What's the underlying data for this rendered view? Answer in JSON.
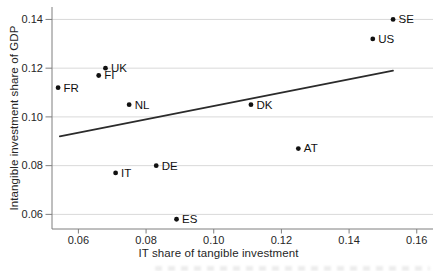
{
  "chart_data": {
    "type": "scatter",
    "title": "",
    "xlabel": "IT share of tangible investment",
    "ylabel": "Intangible investment share of GDP",
    "xlim": [
      0.0522,
      0.1648
    ],
    "ylim": [
      0.054,
      0.1451
    ],
    "grid": "horizontal-only",
    "legend": "none",
    "xticks": {
      "values": [
        0.06,
        0.08,
        0.1,
        0.12,
        0.14,
        0.16
      ],
      "labels": [
        "0.06",
        "0.08",
        "0.10",
        "0.12",
        "0.14",
        "0.16"
      ]
    },
    "yticks": {
      "values": [
        0.06,
        0.08,
        0.1,
        0.12,
        0.14
      ],
      "labels": [
        "0.06",
        "0.08",
        "0.10",
        "0.12",
        "0.14"
      ]
    },
    "points": [
      {
        "label": "SE",
        "x": 0.153,
        "y": 0.14
      },
      {
        "label": "US",
        "x": 0.147,
        "y": 0.132
      },
      {
        "label": "UK",
        "x": 0.068,
        "y": 0.12
      },
      {
        "label": "FI",
        "x": 0.066,
        "y": 0.117
      },
      {
        "label": "FR",
        "x": 0.054,
        "y": 0.112
      },
      {
        "label": "NL",
        "x": 0.075,
        "y": 0.105
      },
      {
        "label": "DK",
        "x": 0.111,
        "y": 0.105
      },
      {
        "label": "AT",
        "x": 0.125,
        "y": 0.087
      },
      {
        "label": "DE",
        "x": 0.083,
        "y": 0.08
      },
      {
        "label": "IT",
        "x": 0.071,
        "y": 0.077
      },
      {
        "label": "ES",
        "x": 0.089,
        "y": 0.058
      }
    ],
    "trendline": {
      "x1": 0.0545,
      "y1": 0.092,
      "x2": 0.153,
      "y2": 0.119
    },
    "colors": {
      "point": "#111111",
      "point_label": "#111111",
      "trend": "#2b2b2b",
      "grid": "#d9d9d9",
      "axis": "#7f7f7f",
      "tick_text": "#262626",
      "background": "#ffffff"
    }
  }
}
